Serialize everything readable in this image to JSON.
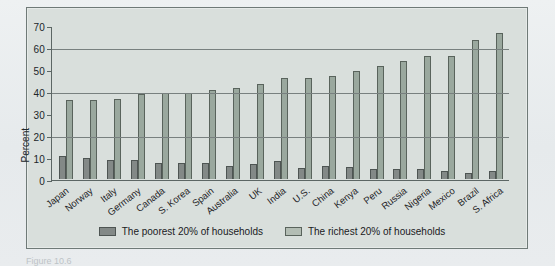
{
  "figure": {
    "caption_partial": "Figure 10.6",
    "y_axis_title": "Percent"
  },
  "legend": {
    "items": [
      {
        "label": "The poorest 20% of households",
        "series": "poorest",
        "color": "#838987"
      },
      {
        "label": "The richest 20% of households",
        "series": "richest",
        "color": "#b3bdb4"
      }
    ]
  },
  "chart_data": {
    "type": "bar",
    "title": "",
    "subtitle": "",
    "xlabel": "",
    "ylabel": "Percent",
    "ylim": [
      0,
      70
    ],
    "yticks": [
      0,
      10,
      20,
      30,
      40,
      50,
      60,
      70
    ],
    "gridlines": [
      20,
      40,
      60
    ],
    "grid": true,
    "legend_position": "bottom",
    "orientation": "vertical",
    "categories": [
      "Japan",
      "Norway",
      "Italy",
      "Germany",
      "Canada",
      "S. Korea",
      "Spain",
      "Australia",
      "UK",
      "India",
      "U.S.",
      "China",
      "Kenya",
      "Peru",
      "Russia",
      "Nigeria",
      "Mexico",
      "Brazil",
      "S. Africa"
    ],
    "series": [
      {
        "name": "The poorest 20% of households",
        "color": "#838987",
        "values": [
          10.6,
          9.6,
          8.7,
          8.5,
          7.5,
          7.5,
          7.5,
          5.9,
          6.6,
          8.1,
          5.2,
          5.9,
          5.6,
          4.4,
          4.4,
          4.4,
          3.6,
          2.6,
          3.5
        ]
      },
      {
        "name": "The richest 20% of households",
        "color": "#9aa89e",
        "values": [
          35.7,
          35.8,
          36.3,
          38.5,
          39.3,
          39.3,
          40.3,
          41.3,
          43.2,
          46.1,
          45.8,
          46.6,
          49.1,
          51.2,
          53.7,
          55.7,
          55.9,
          63.0,
          66.5
        ]
      }
    ]
  }
}
